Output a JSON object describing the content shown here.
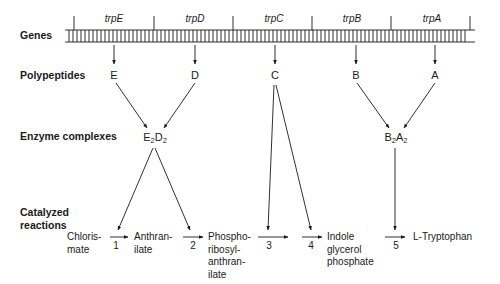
{
  "row_labels": {
    "genes": "Genes",
    "polypeptides": "Polypeptides",
    "enzyme_complexes": "Enzyme complexes",
    "catalyzed_reactions": "Catalyzed\nreactions"
  },
  "genes": [
    "trpE",
    "trpD",
    "trpC",
    "trpB",
    "trpA"
  ],
  "polypeptides": [
    "E",
    "D",
    "C",
    "B",
    "A"
  ],
  "enzyme_complexes": [
    {
      "parts": [
        "E",
        "2",
        "D",
        "2"
      ],
      "from": [
        "E",
        "D"
      ]
    },
    {
      "parts": [
        "B",
        "2",
        "A",
        "2"
      ],
      "from": [
        "B",
        "A"
      ]
    }
  ],
  "compounds": [
    "Chloris-\nmate",
    "Anthran-\nilate",
    "Phospho-\nribosyl-\nanthran-\nilate",
    "Indole\nglycerol\nphosphate",
    "L-Tryptophan"
  ],
  "reaction_numbers": [
    "1",
    "2",
    "3",
    "4",
    "5"
  ],
  "catalysis": {
    "E2D2": [
      "1",
      "2"
    ],
    "C": [
      "3",
      "4"
    ],
    "B2A2": [
      "5"
    ]
  }
}
